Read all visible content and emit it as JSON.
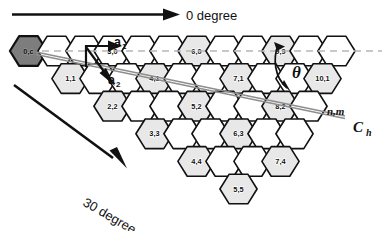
{
  "figure": {
    "colors": {
      "origin_fill": "#7d7d7d",
      "shaded_fill": "#e8e8e8",
      "plain_fill": "#ffffff",
      "outline": "#111111",
      "dashed_guide": "#b7b7b7",
      "chiral_vector_line": "#8e8e8e",
      "background": "#ffffff"
    }
  },
  "annotations": {
    "zero_degree_label": "0 degree",
    "thirty_degree_label": "30 degree",
    "lattice_vector_a1": "a",
    "lattice_vector_a1_sub": "1",
    "lattice_vector_a2": "a",
    "lattice_vector_a2_sub": "2",
    "theta_symbol": "θ",
    "generic_index_label": "n,m",
    "chiral_vector_label": "C",
    "chiral_vector_sub": "h"
  },
  "lattice": {
    "geometry": {
      "hex_radius": 18.6,
      "col_pitch": 28.0,
      "row_pitch": 27.6,
      "row_offset": 14.0,
      "origin_x": 28.5,
      "origin_y": 51.0,
      "rows": 6,
      "columns_per_row": [
        10,
        10,
        9,
        8,
        7,
        5
      ]
    },
    "cells": [
      {
        "row": 0,
        "col": 0,
        "label": "0,c",
        "style": "origin"
      },
      {
        "row": 0,
        "col": 1,
        "label": "",
        "style": "plain"
      },
      {
        "row": 0,
        "col": 2,
        "label": "",
        "style": "plain"
      },
      {
        "row": 0,
        "col": 3,
        "label": "3,0",
        "style": "plain"
      },
      {
        "row": 0,
        "col": 4,
        "label": "",
        "style": "plain"
      },
      {
        "row": 0,
        "col": 5,
        "label": "",
        "style": "plain"
      },
      {
        "row": 0,
        "col": 6,
        "label": "6,0",
        "style": "shaded"
      },
      {
        "row": 0,
        "col": 7,
        "label": "",
        "style": "plain"
      },
      {
        "row": 0,
        "col": 8,
        "label": "",
        "style": "plain"
      },
      {
        "row": 0,
        "col": 9,
        "label": "9,9",
        "style": "shaded"
      },
      {
        "row": 0,
        "col": 10,
        "label": "",
        "style": "plain"
      },
      {
        "row": 0,
        "col": 11,
        "label": "",
        "style": "plain"
      },
      {
        "row": 1,
        "col": 1,
        "label": "1,1",
        "style": "shaded"
      },
      {
        "row": 1,
        "col": 2,
        "label": "",
        "style": "plain"
      },
      {
        "row": 1,
        "col": 3,
        "label": "",
        "style": "plain"
      },
      {
        "row": 1,
        "col": 4,
        "label": "4,1",
        "style": "shaded"
      },
      {
        "row": 1,
        "col": 5,
        "label": "",
        "style": "plain"
      },
      {
        "row": 1,
        "col": 6,
        "label": "",
        "style": "plain"
      },
      {
        "row": 1,
        "col": 7,
        "label": "7,1",
        "style": "shaded"
      },
      {
        "row": 1,
        "col": 8,
        "label": "",
        "style": "plain"
      },
      {
        "row": 1,
        "col": 9,
        "label": "",
        "style": "plain"
      },
      {
        "row": 1,
        "col": 10,
        "label": "10,1",
        "style": "shaded"
      },
      {
        "row": 2,
        "col": 2,
        "label": "2,2",
        "style": "shaded"
      },
      {
        "row": 2,
        "col": 3,
        "label": "",
        "style": "plain"
      },
      {
        "row": 2,
        "col": 4,
        "label": "",
        "style": "plain"
      },
      {
        "row": 2,
        "col": 5,
        "label": "5,2",
        "style": "shaded"
      },
      {
        "row": 2,
        "col": 6,
        "label": "",
        "style": "plain"
      },
      {
        "row": 2,
        "col": 7,
        "label": "",
        "style": "plain"
      },
      {
        "row": 2,
        "col": 8,
        "label": "8,2",
        "style": "shaded"
      },
      {
        "row": 2,
        "col": 9,
        "label": "",
        "style": "plain"
      },
      {
        "row": 3,
        "col": 3,
        "label": "3,3",
        "style": "shaded"
      },
      {
        "row": 3,
        "col": 4,
        "label": "",
        "style": "plain"
      },
      {
        "row": 3,
        "col": 5,
        "label": "",
        "style": "plain"
      },
      {
        "row": 3,
        "col": 6,
        "label": "6,3",
        "style": "shaded"
      },
      {
        "row": 3,
        "col": 7,
        "label": "",
        "style": "plain"
      },
      {
        "row": 3,
        "col": 8,
        "label": "",
        "style": "plain"
      },
      {
        "row": 4,
        "col": 4,
        "label": "4,4",
        "style": "shaded"
      },
      {
        "row": 4,
        "col": 5,
        "label": "",
        "style": "plain"
      },
      {
        "row": 4,
        "col": 6,
        "label": "",
        "style": "plain"
      },
      {
        "row": 4,
        "col": 7,
        "label": "7,4",
        "style": "shaded"
      },
      {
        "row": 5,
        "col": 5,
        "label": "5,5",
        "style": "shaded"
      }
    ]
  }
}
